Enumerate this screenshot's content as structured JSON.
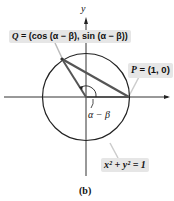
{
  "figure": {
    "caption": "(b)",
    "axis_y_label": "y",
    "point_q": {
      "label": "Q",
      "equals": " = ",
      "coords": "(cos (α − β), sin (α − β))"
    },
    "point_p": {
      "label": "P",
      "equals": " = ",
      "coords": "(1, 0)"
    },
    "angle_label": "α − β",
    "circle_equation": "x² + y² = 1",
    "colors": {
      "line": "#222222",
      "chord": "#555555",
      "label_bg": "#e6e6e6",
      "leader": "#bbbbbb"
    }
  }
}
